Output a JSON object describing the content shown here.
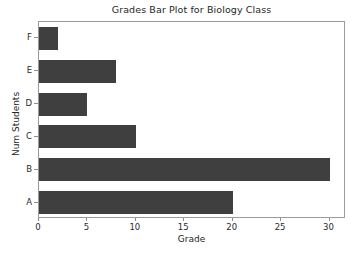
{
  "chart_data": {
    "type": "bar",
    "orientation": "horizontal",
    "title": "Grades Bar Plot for Biology Class",
    "xlabel": "Grade",
    "ylabel": "Num Students",
    "categories": [
      "A",
      "B",
      "C",
      "D",
      "E",
      "F"
    ],
    "values": [
      20,
      30,
      10,
      5,
      8,
      2
    ],
    "xlim": [
      0,
      31.7
    ],
    "xticks": [
      0,
      5,
      10,
      15,
      20,
      25,
      30
    ],
    "xticklabels": [
      "0",
      "5",
      "10",
      "15",
      "20",
      "25",
      "30"
    ],
    "yticklabels_top_to_bottom": [
      "F",
      "E",
      "D",
      "C",
      "B",
      "A"
    ],
    "grid": false,
    "legend": null,
    "bar_color": "#3f3f3f",
    "background_color": "#ffffff",
    "axes_edge_color": "#9a9a9a",
    "text_color": "#262626"
  }
}
